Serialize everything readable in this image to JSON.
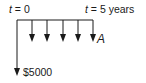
{
  "diagram": {
    "type": "cash-flow-diagram",
    "start_label": {
      "var": "t",
      "eq": " = 0"
    },
    "end_label": {
      "var": "t",
      "eq": " = 5 years"
    },
    "initial_flow": {
      "label": "$5000",
      "direction": "down"
    },
    "annuity": {
      "label": "A",
      "count": 5,
      "direction": "down"
    },
    "colors": {
      "line": "#1a1a1a",
      "background": "#ffffff"
    }
  }
}
